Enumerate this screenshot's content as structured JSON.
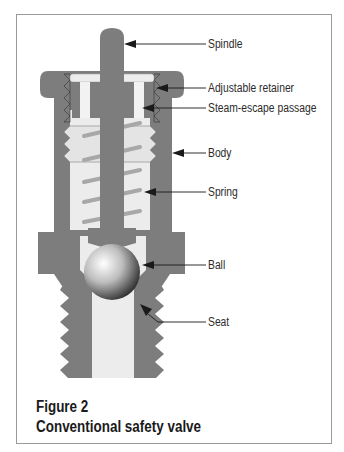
{
  "figure": {
    "number_label": "Figure 2",
    "title": "Conventional safety valve"
  },
  "labels": [
    {
      "id": "spindle",
      "text": "Spindle"
    },
    {
      "id": "adjustable-retainer",
      "text": "Adjustable retainer"
    },
    {
      "id": "steam-escape-passage",
      "text": "Steam-escape passage"
    },
    {
      "id": "body",
      "text": "Body"
    },
    {
      "id": "spring",
      "text": "Spring"
    },
    {
      "id": "ball",
      "text": "Ball"
    },
    {
      "id": "seat",
      "text": "Seat"
    }
  ],
  "colors": {
    "metal": "#7d7d7d",
    "cavity": "#ececec",
    "spring": "#a8a8a8",
    "leader": "#1a1a1a",
    "frame": "#9a9a9a"
  }
}
